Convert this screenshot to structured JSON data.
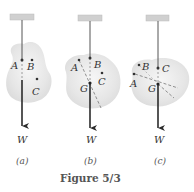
{
  "figure": {
    "caption": "Figure 5/3",
    "panels": [
      {
        "id": "a",
        "sublabel": "(a)",
        "force_label": "W",
        "points": [
          {
            "label": "A",
            "role": "suspension point"
          },
          {
            "label": "B"
          },
          {
            "label": "C"
          }
        ]
      },
      {
        "id": "b",
        "sublabel": "(b)",
        "force_label": "W",
        "points": [
          {
            "label": "A"
          },
          {
            "label": "B",
            "role": "suspension point"
          },
          {
            "label": "C"
          },
          {
            "label": "G",
            "role": "center of gravity"
          }
        ]
      },
      {
        "id": "c",
        "sublabel": "(c)",
        "force_label": "W",
        "points": [
          {
            "label": "B"
          },
          {
            "label": "C",
            "role": "suspension point"
          },
          {
            "label": "A"
          },
          {
            "label": "G",
            "role": "center of gravity"
          }
        ]
      }
    ]
  },
  "colors": {
    "body_fill": "#e9e9e9",
    "support": "#cfcfcf",
    "line": "#2b2b2b",
    "dashed": "#777777",
    "text": "#333333"
  }
}
